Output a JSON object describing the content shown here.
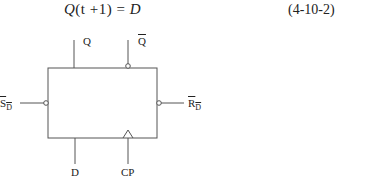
{
  "equation": {
    "lhs_symbol": "Q",
    "lhs_arg": "(t +1)",
    "eq": " = ",
    "rhs": "D",
    "number": "(4-10-2)"
  },
  "diagram": {
    "type": "D flip-flop block symbol",
    "labels": {
      "q": "Q",
      "q_bar": "Q",
      "sd_bar": "S",
      "sd_sub": "D",
      "rd_bar": "R",
      "rd_sub": "D",
      "d": "D",
      "cp": "CP"
    },
    "colors": {
      "stroke": "#555555",
      "text": "#222222",
      "background": "#ffffff"
    }
  }
}
